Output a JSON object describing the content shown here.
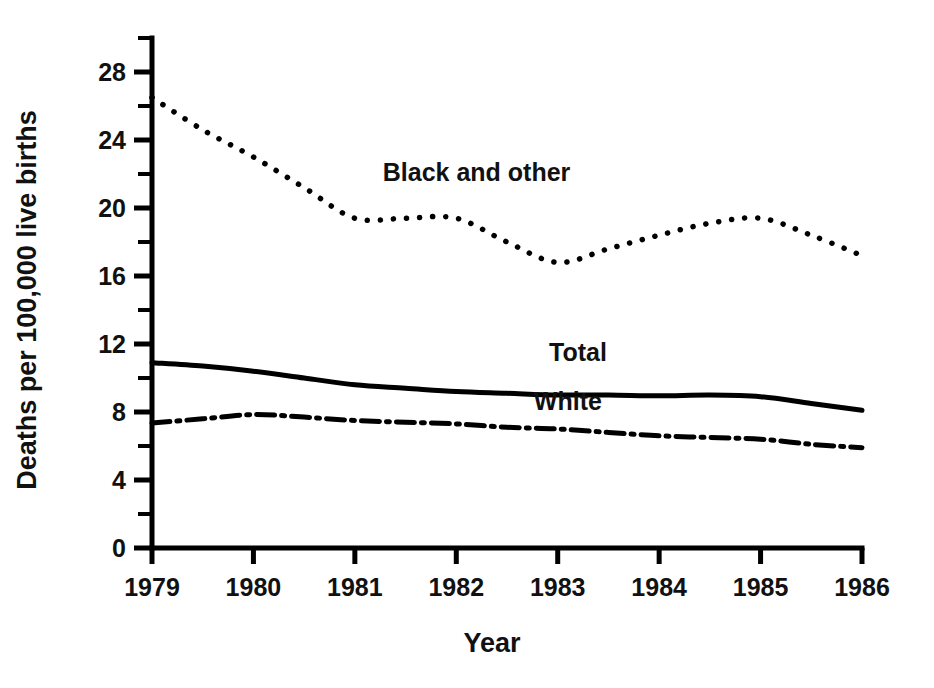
{
  "chart_data": {
    "type": "line",
    "title": "",
    "xlabel": "Year",
    "ylabel": "Deaths per 100,000 live births",
    "x": [
      1979,
      1980,
      1981,
      1982,
      1983,
      1984,
      1985,
      1986
    ],
    "xlim": [
      1979,
      1986
    ],
    "ylim": [
      0,
      30
    ],
    "ytick_labels": [
      "0",
      "4",
      "8",
      "12",
      "16",
      "20",
      "24",
      "28"
    ],
    "ytick_values": [
      0,
      4,
      8,
      12,
      16,
      20,
      24,
      28
    ],
    "yminor_values": [
      2,
      6,
      10,
      14,
      18,
      22,
      26,
      30
    ],
    "xtick_labels": [
      "1979",
      "1980",
      "1981",
      "1982",
      "1983",
      "1984",
      "1985",
      "1986"
    ],
    "grid": false,
    "legend_position": "inline-annotations",
    "series": [
      {
        "name": "Black and other",
        "style": "dotted",
        "label_x": 1982.2,
        "label_y": 21.6,
        "points": [
          [
            1979.0,
            26.5
          ],
          [
            1979.5,
            24.6
          ],
          [
            1980.0,
            23.0
          ],
          [
            1980.5,
            21.2
          ],
          [
            1981.0,
            19.4
          ],
          [
            1981.5,
            19.4
          ],
          [
            1982.0,
            19.4
          ],
          [
            1982.5,
            18.0
          ],
          [
            1983.0,
            16.8
          ],
          [
            1983.5,
            17.6
          ],
          [
            1984.0,
            18.4
          ],
          [
            1984.5,
            19.1
          ],
          [
            1985.0,
            19.4
          ],
          [
            1985.5,
            18.4
          ],
          [
            1986.0,
            17.2
          ]
        ]
      },
      {
        "name": "Total",
        "style": "solid",
        "label_x": 1983.2,
        "label_y": 11.0,
        "points": [
          [
            1979.0,
            10.9
          ],
          [
            1979.5,
            10.7
          ],
          [
            1980.0,
            10.4
          ],
          [
            1980.5,
            10.0
          ],
          [
            1981.0,
            9.6
          ],
          [
            1981.5,
            9.4
          ],
          [
            1982.0,
            9.2
          ],
          [
            1982.5,
            9.1
          ],
          [
            1983.0,
            9.0
          ],
          [
            1983.5,
            9.0
          ],
          [
            1984.0,
            8.95
          ],
          [
            1984.5,
            9.0
          ],
          [
            1985.0,
            8.9
          ],
          [
            1985.5,
            8.5
          ],
          [
            1986.0,
            8.1
          ]
        ]
      },
      {
        "name": "White",
        "style": "dash-dot",
        "label_x": 1983.1,
        "label_y": 8.1,
        "points": [
          [
            1979.0,
            7.35
          ],
          [
            1979.5,
            7.6
          ],
          [
            1980.0,
            7.85
          ],
          [
            1980.5,
            7.7
          ],
          [
            1981.0,
            7.5
          ],
          [
            1981.5,
            7.4
          ],
          [
            1982.0,
            7.3
          ],
          [
            1982.5,
            7.1
          ],
          [
            1983.0,
            7.0
          ],
          [
            1983.5,
            6.8
          ],
          [
            1984.0,
            6.6
          ],
          [
            1984.5,
            6.5
          ],
          [
            1985.0,
            6.4
          ],
          [
            1985.5,
            6.1
          ],
          [
            1986.0,
            5.9
          ]
        ]
      }
    ]
  }
}
